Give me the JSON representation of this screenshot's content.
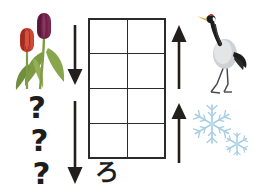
{
  "canvas": {
    "width": 256,
    "height": 194,
    "background_color": "#ffffff",
    "description": "Seasonal sequence puzzle worksheet"
  },
  "grid": {
    "name": "empty-answer-grid",
    "columns": 2,
    "rows": 4,
    "total_cells": 8,
    "cells": [
      "",
      "",
      "",
      "",
      "",
      "",
      "",
      ""
    ],
    "border_color": "#2b2b2b",
    "fill_color": "#ffffff"
  },
  "kana": {
    "label": "ろ",
    "romaji_hint": "ro",
    "color": "#1d1d1d"
  },
  "arrows": [
    {
      "id": "arrow-down-top",
      "direction": "down",
      "side": "left",
      "position": "upper",
      "color": "#231f1c"
    },
    {
      "id": "arrow-down-bottom",
      "direction": "down",
      "side": "left",
      "position": "lower",
      "color": "#231f1c"
    },
    {
      "id": "arrow-up-top",
      "direction": "up",
      "side": "right",
      "position": "upper",
      "color": "#231f1c"
    },
    {
      "id": "arrow-up-bottom",
      "direction": "up",
      "side": "right",
      "position": "lower",
      "color": "#231f1c"
    }
  ],
  "illustrations": {
    "tulips": {
      "name": "tulips-illustration",
      "alt": "Two tulips with green leaves",
      "flower_colors": [
        "#c0392b",
        "#6e2246"
      ],
      "leaf_color": "#6f8f3e",
      "stem_color": "#7f9c45"
    },
    "crane": {
      "name": "crane-illustration",
      "alt": "Red-crowned crane standing",
      "body_color": "#cfd2d4",
      "accent_color": "#1c1c1c",
      "beak_color": "#d8a62c",
      "crown_color": "#c0392b"
    },
    "snowflakes": {
      "name": "snowflakes-illustration",
      "alt": "Two light blue snowflakes",
      "color": "#a9cfe4",
      "count": 2
    }
  },
  "question_marks": {
    "name": "question-marks-placeholder",
    "glyph": "?",
    "count": 3,
    "items": [
      "?",
      "?",
      "?"
    ],
    "color": "#1d1d1d"
  }
}
